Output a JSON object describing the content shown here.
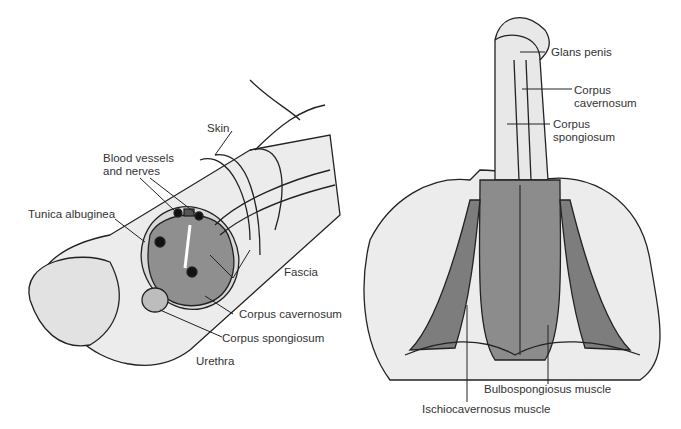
{
  "left_diagram": {
    "labels": {
      "skin": "Skin",
      "blood_vessels_1": "Blood vessels",
      "blood_vessels_2": "and nerves",
      "tunica": "Tunica albuginea",
      "fascia": "Fascia",
      "corpus_cavernosum": "Corpus cavernosum",
      "corpus_spongiosum": "Corpus spongiosum",
      "urethra": "Urethra"
    }
  },
  "right_diagram": {
    "labels": {
      "glans": "Glans penis",
      "cavernosum_1": "Corpus",
      "cavernosum_2": "cavernosum",
      "spongiosum_1": "Corpus",
      "spongiosum_2": "spongiosum",
      "bulbospongiosus": "Bulbospongiosus muscle",
      "ischiocavernosus": "Ischiocavernosus muscle"
    }
  },
  "colors": {
    "tissue": "#e6e6e6",
    "muscle": "#8a8a8a",
    "erectile": "#9a9a9a",
    "outline": "#222222"
  }
}
